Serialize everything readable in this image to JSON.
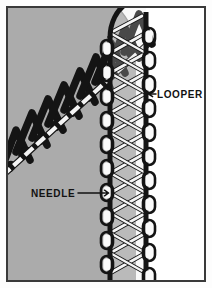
{
  "figure": {
    "type": "line-art-technical-illustration",
    "frame": {
      "border_color": "#3a3a3a",
      "border_width_px": 2,
      "background_color": "#ffffff",
      "inset_px": 6
    },
    "palette": {
      "fabric_gray": "#ababab",
      "thread_dark": "#141414",
      "thread_light": "#f4f4f4",
      "paper_white": "#ffffff",
      "ink": "#121212"
    }
  },
  "fabric": {
    "name": "fabric-panel",
    "fill": "#ababab",
    "description": "Gray fabric panel occupying the left and lower portion of the frame, its upper-right edge cut away on a diagonal that curves down into the vertical seam."
  },
  "labels": [
    {
      "id": "looper",
      "text": "LOOPER",
      "arrow": "left",
      "arrow_glyph": "←",
      "x": 150,
      "y": 94,
      "points_to": "seam-column-right-loops"
    },
    {
      "id": "needle",
      "text": "NEEDLE",
      "arrow": "right",
      "arrow_glyph": "→",
      "x": 31,
      "y": 193,
      "points_to": "seam-column-needle-rail"
    }
  ],
  "elements": {
    "zigzag_stitch": {
      "name": "diagonal-zigzag-stitch",
      "color": "#141414",
      "peaks": 9,
      "description": "Heavy black zigzag (chain of narrow inverted-V loops) running diagonally from lower-left to upper-right across the fabric."
    },
    "beaded_diagonal": {
      "name": "diagonal-needle-thread-line",
      "color": "#f4f4f4",
      "description": "White beaded/segmented thread line running along the diagonal beneath the zigzag peaks."
    },
    "seam_column": {
      "name": "vertical-seam-column",
      "rail_color": "#141414",
      "thread_color": "#f4f4f4",
      "left_x": 108,
      "right_x": 148,
      "rungs": 13,
      "loops_per_side": 10,
      "description": "Vertical serged seam: two dark rails with white diagonal looper threads crossing between them and white oval loops along each outer edge."
    }
  }
}
